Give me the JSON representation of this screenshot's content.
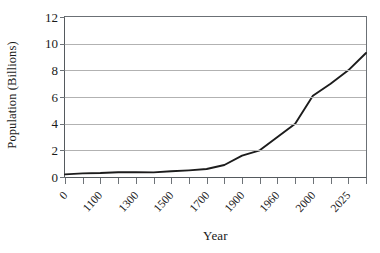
{
  "chart_data": {
    "type": "line",
    "title": "",
    "xlabel": "Year",
    "ylabel": "Population (Billions)",
    "ylim": [
      0,
      12
    ],
    "y_ticks": [
      12,
      10,
      8,
      6,
      4,
      2,
      0
    ],
    "grid": true,
    "grid_axis": "y",
    "legend": "none",
    "x_tick_labels": [
      "0",
      "1100",
      "1300",
      "1500",
      "1700",
      "1900",
      "1960",
      "2000",
      "2025"
    ],
    "x_all_tick_count": 17,
    "categories": [
      "0",
      "1000",
      "1100",
      "1200",
      "1300",
      "1400",
      "1500",
      "1600",
      "1700",
      "1800",
      "1900",
      "1930",
      "1960",
      "1975",
      "2000",
      "2012",
      "2025",
      "2050"
    ],
    "values": [
      0.2,
      0.27,
      0.3,
      0.36,
      0.36,
      0.35,
      0.43,
      0.5,
      0.6,
      0.9,
      1.6,
      2.0,
      3.0,
      4.0,
      6.1,
      7.0,
      8.0,
      9.3
    ],
    "series": [
      {
        "name": "World population",
        "color": "#1c1c1c",
        "points": [
          {
            "x": 0,
            "y": 0.2
          },
          {
            "x": 1,
            "y": 0.27
          },
          {
            "x": 2,
            "y": 0.3
          },
          {
            "x": 3,
            "y": 0.36
          },
          {
            "x": 4,
            "y": 0.36
          },
          {
            "x": 5,
            "y": 0.35
          },
          {
            "x": 6,
            "y": 0.43
          },
          {
            "x": 7,
            "y": 0.5
          },
          {
            "x": 8,
            "y": 0.6
          },
          {
            "x": 9,
            "y": 0.9
          },
          {
            "x": 10,
            "y": 1.6
          },
          {
            "x": 11,
            "y": 2.0
          },
          {
            "x": 12,
            "y": 3.0
          },
          {
            "x": 13,
            "y": 4.0
          },
          {
            "x": 14,
            "y": 6.1
          },
          {
            "x": 15,
            "y": 7.0
          },
          {
            "x": 16,
            "y": 8.0
          },
          {
            "x": 17,
            "y": 9.3
          }
        ]
      }
    ],
    "colors": {
      "line": "#1c1c1c",
      "gridline": "#b2b2b2",
      "axis": "#5c6165",
      "text": "#1a1a1a",
      "background": "#ffffff"
    }
  }
}
